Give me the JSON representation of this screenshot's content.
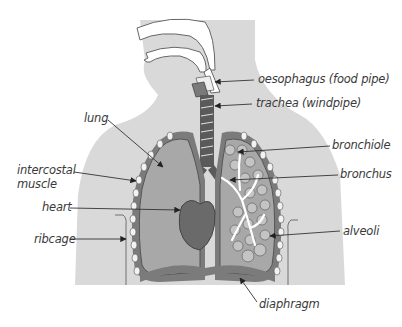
{
  "diagram": {
    "colors": {
      "body_silhouette": "#d9d9d9",
      "pleura_outline": "#6e6e6e",
      "lung_fill": "#a8a8a8",
      "heart_fill": "#6a6a6a",
      "trachea_ring": "#555555",
      "airway_white": "#ffffff",
      "alveoli_fill": "#c4c4c4",
      "label_text": "#3a3a3a",
      "arrow": "#333333"
    },
    "labels": {
      "oesophagus": "oesophagus (food pipe)",
      "trachea": "trachea (windpipe)",
      "lung": "lung",
      "bronchiole": "bronchiole",
      "intercostal_line1": "intercostal",
      "intercostal_line2": "muscle",
      "bronchus": "bronchus",
      "heart": "heart",
      "ribcage": "ribcage",
      "alveoli": "alveoli",
      "diaphragm": "diaphragm"
    }
  }
}
